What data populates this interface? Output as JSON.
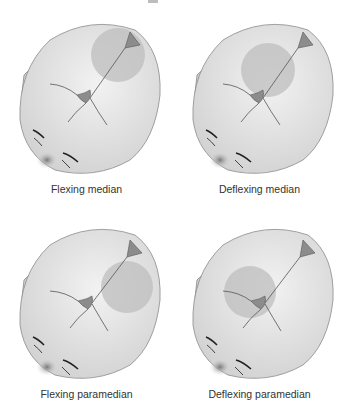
{
  "figure": {
    "panels": [
      {
        "id": "flexing-median",
        "caption": "Flexing median",
        "circle": {
          "cx": 118,
          "cy": 55,
          "r": 27
        },
        "x": 0,
        "y": 0,
        "caption_y": 183
      },
      {
        "id": "deflexing-median",
        "caption": "Deflexing median",
        "circle": {
          "cx": 95,
          "cy": 70,
          "r": 27
        },
        "x": 173,
        "y": 0,
        "caption_y": 183
      },
      {
        "id": "flexing-paramedian",
        "caption": "Flexing paramedian",
        "circle": {
          "cx": 127,
          "cy": 82,
          "r": 26
        },
        "x": 0,
        "y": 205,
        "caption_y": 183
      },
      {
        "id": "deflexing-paramedian",
        "caption": "Deflexing paramedian",
        "circle": {
          "cx": 77,
          "cy": 87,
          "r": 26
        },
        "x": 173,
        "y": 205,
        "caption_y": 183
      }
    ],
    "colors": {
      "head_fill": "#e4e4e4",
      "head_stroke": "#8a8a8a",
      "circle_fill": "#bdbdbd",
      "fontanelle_fill": "#8c8c8c",
      "suture": "#555555",
      "text": "#333333"
    }
  }
}
